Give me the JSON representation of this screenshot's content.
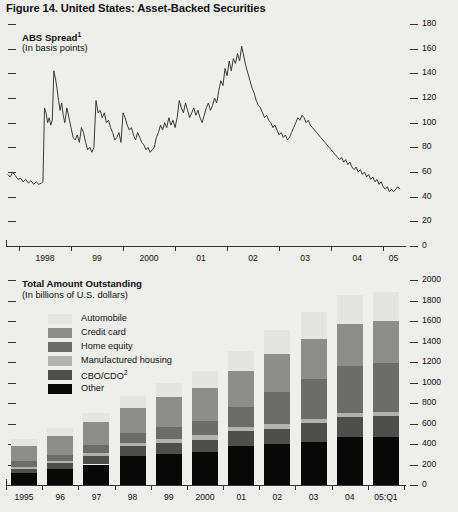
{
  "figure": {
    "title": "Figure 14. United States: Asset-Backed Securities"
  },
  "panel_spread": {
    "title": "ABS Spread",
    "title_footnote": "1",
    "subtitle": "(In basis points)"
  },
  "panel_outstanding": {
    "title": "Total Amount Outstanding",
    "subtitle": "(In billions of U.S. dollars)"
  },
  "legend": {
    "items": [
      {
        "label": "Automobile",
        "color": "#e4e4e2"
      },
      {
        "label": "Credit card",
        "color": "#8d8d8b"
      },
      {
        "label": "Home equity",
        "color": "#6c6c6a"
      },
      {
        "label": "Manufactured housing",
        "color": "#b2b2b0"
      },
      {
        "label": "CBO/CDO",
        "footnote": "2",
        "color": "#4e4e4c"
      },
      {
        "label": "Other",
        "color": "#080808"
      }
    ]
  },
  "chart_data": [
    {
      "type": "line",
      "title": "ABS Spread",
      "subtitle": "(In basis points)",
      "xlabel": "",
      "ylabel": "Basis points",
      "ylim": [
        0,
        180
      ],
      "yticks": [
        0,
        20,
        40,
        60,
        80,
        100,
        120,
        140,
        160,
        180
      ],
      "xlim": [
        1997.75,
        2005.4
      ],
      "xtick_values": [
        1998,
        1999,
        2000,
        2001,
        2002,
        2003,
        2004,
        2005
      ],
      "xtick_labels": [
        "1998",
        "99",
        "2000",
        "01",
        "02",
        "03",
        "04",
        "05"
      ],
      "grid": false,
      "legend": "none",
      "series": [
        {
          "name": "ABS spread",
          "color": "#3a3a3a",
          "x": [
            1997.78,
            1997.83,
            1997.88,
            1997.93,
            1997.98,
            1998.03,
            1998.08,
            1998.13,
            1998.18,
            1998.23,
            1998.28,
            1998.33,
            1998.38,
            1998.43,
            1998.46,
            1998.49,
            1998.52,
            1998.55,
            1998.58,
            1998.61,
            1998.64,
            1998.67,
            1998.7,
            1998.73,
            1998.76,
            1998.79,
            1998.82,
            1998.85,
            1998.88,
            1998.92,
            1998.96,
            1999.0,
            1999.04,
            1999.08,
            1999.12,
            1999.16,
            1999.2,
            1999.24,
            1999.28,
            1999.32,
            1999.36,
            1999.4,
            1999.44,
            1999.48,
            1999.52,
            1999.56,
            1999.6,
            1999.64,
            1999.68,
            1999.72,
            1999.76,
            1999.8,
            1999.84,
            1999.88,
            1999.92,
            1999.96,
            2000.0,
            2000.04,
            2000.08,
            2000.12,
            2000.16,
            2000.2,
            2000.24,
            2000.28,
            2000.32,
            2000.36,
            2000.4,
            2000.44,
            2000.48,
            2000.52,
            2000.56,
            2000.6,
            2000.64,
            2000.68,
            2000.72,
            2000.76,
            2000.8,
            2000.84,
            2000.88,
            2000.92,
            2000.96,
            2001.0,
            2001.04,
            2001.08,
            2001.12,
            2001.16,
            2001.2,
            2001.24,
            2001.28,
            2001.32,
            2001.36,
            2001.4,
            2001.44,
            2001.48,
            2001.52,
            2001.56,
            2001.6,
            2001.64,
            2001.68,
            2001.72,
            2001.76,
            2001.8,
            2001.84,
            2001.88,
            2001.92,
            2001.96,
            2002.0,
            2002.04,
            2002.08,
            2002.12,
            2002.16,
            2002.2,
            2002.24,
            2002.28,
            2002.32,
            2002.36,
            2002.4,
            2002.44,
            2002.48,
            2002.52,
            2002.56,
            2002.6,
            2002.64,
            2002.68,
            2002.72,
            2002.76,
            2002.8,
            2002.84,
            2002.88,
            2002.92,
            2002.96,
            2003.0,
            2003.04,
            2003.08,
            2003.12,
            2003.16,
            2003.2,
            2003.24,
            2003.28,
            2003.32,
            2003.36,
            2003.4,
            2003.44,
            2003.48,
            2003.52,
            2003.56,
            2003.6,
            2003.64,
            2003.68,
            2003.72,
            2003.76,
            2003.8,
            2003.84,
            2003.88,
            2003.92,
            2003.96,
            2004.0,
            2004.04,
            2004.08,
            2004.12,
            2004.16,
            2004.2,
            2004.24,
            2004.28,
            2004.32,
            2004.36,
            2004.4,
            2004.44,
            2004.48,
            2004.52,
            2004.56,
            2004.6,
            2004.64,
            2004.68,
            2004.72,
            2004.76,
            2004.8,
            2004.84,
            2004.88,
            2004.92,
            2004.96,
            2005.0,
            2005.04,
            2005.08,
            2005.12,
            2005.16,
            2005.2,
            2005.24,
            2005.28,
            2005.32
          ],
          "y": [
            58,
            56,
            60,
            57,
            54,
            55,
            52,
            54,
            51,
            53,
            50,
            52,
            50,
            51,
            52,
            112,
            108,
            100,
            104,
            98,
            102,
            142,
            136,
            128,
            118,
            110,
            116,
            106,
            100,
            112,
            104,
            96,
            88,
            86,
            90,
            84,
            96,
            92,
            84,
            78,
            80,
            76,
            80,
            118,
            108,
            110,
            104,
            108,
            100,
            102,
            96,
            92,
            86,
            88,
            92,
            84,
            108,
            104,
            98,
            94,
            96,
            90,
            86,
            92,
            88,
            84,
            82,
            78,
            80,
            76,
            78,
            80,
            88,
            92,
            98,
            94,
            100,
            96,
            104,
            98,
            102,
            96,
            104,
            118,
            112,
            108,
            116,
            110,
            104,
            108,
            112,
            106,
            110,
            104,
            100,
            106,
            112,
            116,
            110,
            114,
            120,
            116,
            126,
            134,
            130,
            144,
            138,
            150,
            142,
            152,
            148,
            156,
            150,
            162,
            154,
            146,
            140,
            134,
            128,
            124,
            118,
            114,
            112,
            108,
            104,
            106,
            102,
            100,
            96,
            98,
            94,
            90,
            92,
            88,
            90,
            86,
            88,
            92,
            96,
            100,
            104,
            102,
            106,
            104,
            100,
            102,
            98,
            96,
            94,
            92,
            90,
            88,
            86,
            84,
            82,
            80,
            78,
            76,
            74,
            72,
            70,
            72,
            68,
            70,
            66,
            68,
            64,
            62,
            64,
            60,
            62,
            58,
            60,
            56,
            58,
            54,
            56,
            52,
            54,
            50,
            52,
            48,
            46,
            48,
            44,
            46,
            44,
            46,
            48,
            46,
            48,
            50,
            48
          ]
        }
      ]
    },
    {
      "type": "bar",
      "stacked": true,
      "title": "Total Amount Outstanding",
      "subtitle": "(In billions of U.S. dollars)",
      "xlabel": "",
      "ylabel": "Billions of U.S. dollars",
      "ylim": [
        0,
        2000
      ],
      "yticks": [
        0,
        200,
        400,
        600,
        800,
        1000,
        1200,
        1400,
        1600,
        1800,
        2000
      ],
      "categories": [
        "1995",
        "96",
        "97",
        "98",
        "99",
        "2000",
        "01",
        "02",
        "03",
        "04",
        "05:Q1"
      ],
      "grid": false,
      "legend": "inside-upper-left",
      "series": [
        {
          "name": "Other",
          "color": "#080808",
          "values": [
            118,
            155,
            200,
            285,
            300,
            318,
            382,
            400,
            420,
            465,
            470
          ]
        },
        {
          "name": "CBO/CDO",
          "color": "#4e4e4c",
          "values": [
            42,
            55,
            80,
            95,
            110,
            125,
            140,
            150,
            185,
            200,
            205
          ]
        },
        {
          "name": "Manufactured housing",
          "color": "#b2b2b0",
          "values": [
            18,
            22,
            28,
            32,
            38,
            40,
            42,
            42,
            40,
            38,
            38
          ]
        },
        {
          "name": "Home equity",
          "color": "#6c6c6a",
          "values": [
            55,
            65,
            80,
            92,
            118,
            145,
            195,
            320,
            388,
            460,
            478
          ]
        },
        {
          "name": "Credit card",
          "color": "#8d8d8b",
          "values": [
            152,
            183,
            225,
            250,
            290,
            320,
            350,
            370,
            390,
            405,
            405
          ]
        },
        {
          "name": "Automobile",
          "color": "#e4e4e2",
          "values": [
            60,
            75,
            92,
            110,
            135,
            165,
            195,
            230,
            265,
            285,
            290
          ]
        }
      ],
      "totals": [
        445,
        555,
        705,
        864,
        991,
        1113,
        1304,
        1512,
        1688,
        1853,
        1886
      ]
    }
  ]
}
